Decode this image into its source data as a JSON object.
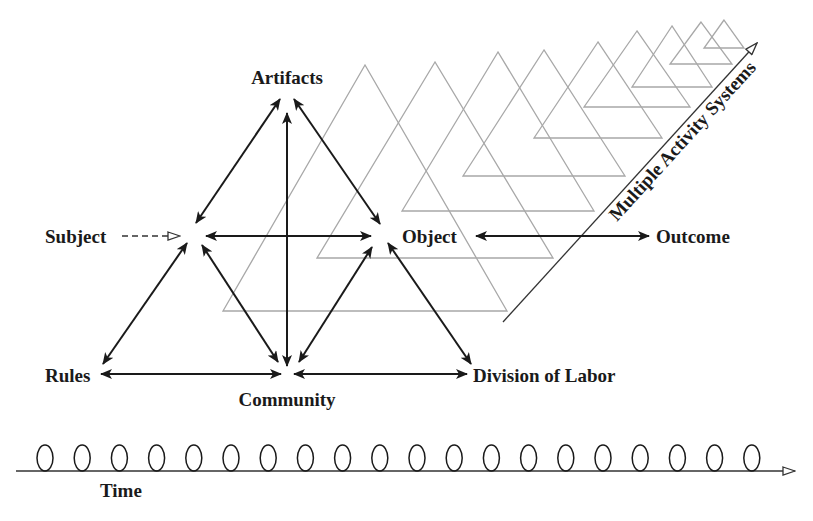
{
  "diagram": {
    "nodes": {
      "artifacts": "Artifacts",
      "subject": "Subject",
      "object": "Object",
      "outcome": "Outcome",
      "rules": "Rules",
      "community": "Community",
      "division_of_labor": "Division of Labor"
    },
    "axis_labels": {
      "multiple_systems": "Multiple Activity Systems",
      "time": "Time"
    },
    "edges": [
      {
        "from": "Subject",
        "to": "Artifacts",
        "type": "bidirectional"
      },
      {
        "from": "Artifacts",
        "to": "Object",
        "type": "bidirectional"
      },
      {
        "from": "Subject",
        "to": "Object",
        "type": "bidirectional"
      },
      {
        "from": "Community",
        "to": "Artifacts",
        "type": "bidirectional"
      },
      {
        "from": "Subject",
        "to": "Rules",
        "type": "bidirectional"
      },
      {
        "from": "Subject",
        "to": "Community",
        "type": "bidirectional"
      },
      {
        "from": "Object",
        "to": "Community",
        "type": "bidirectional"
      },
      {
        "from": "Object",
        "to": "Division of Labor",
        "type": "bidirectional"
      },
      {
        "from": "Rules",
        "to": "Community",
        "type": "bidirectional"
      },
      {
        "from": "Community",
        "to": "Division of Labor",
        "type": "bidirectional"
      },
      {
        "from": "Object",
        "to": "Outcome",
        "type": "bidirectional"
      },
      {
        "from": "Subject",
        "to": "Subject-node",
        "type": "dashed-open-arrow"
      }
    ],
    "time_loops_count": 20,
    "background_triangles_count": 9,
    "colors": {
      "ink": "#1a1a1a",
      "background_triangles": "#a8a8a8",
      "background": "#ffffff"
    }
  }
}
